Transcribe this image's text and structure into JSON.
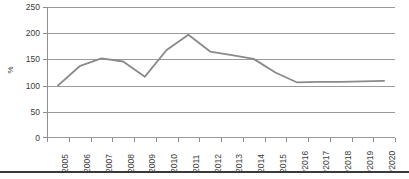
{
  "chart_data": {
    "type": "line",
    "title": "",
    "xlabel": "",
    "ylabel": "%",
    "categories": [
      "2005",
      "2006",
      "2007",
      "2008",
      "2009",
      "2010",
      "2011",
      "2012",
      "2013",
      "2014",
      "2015",
      "*2016",
      "*2017",
      "*2018",
      "*2019",
      "*2020"
    ],
    "values": [
      100,
      137,
      152,
      146,
      117,
      168,
      197,
      165,
      158,
      151,
      125,
      106,
      107,
      107,
      108,
      109
    ],
    "series": [
      {
        "name": "index",
        "values": [
          100,
          137,
          152,
          146,
          117,
          168,
          197,
          165,
          158,
          151,
          125,
          106,
          107,
          107,
          108,
          109
        ]
      }
    ],
    "ylim": [
      0,
      250
    ],
    "ytick_values": [
      0,
      50,
      100,
      150,
      200,
      250
    ],
    "ytick_labels": [
      "0",
      "50",
      "100",
      "150",
      "200",
      "250"
    ],
    "grid": "horizontal",
    "legend": "none",
    "line_color": "#8a8a8a",
    "grid_color": "#9a9a9a",
    "axis_color": "#8f8f8f",
    "text_color": "#3b3b3b",
    "background": "#ffffff"
  }
}
